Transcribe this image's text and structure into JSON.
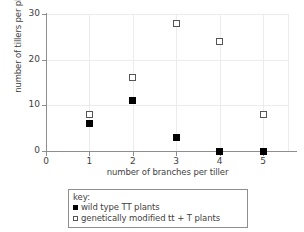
{
  "chart_data": {
    "type": "scatter",
    "title": "",
    "xlabel": "number of branches per tiller",
    "ylabel": "number of tillers per plant",
    "x": [
      1,
      2,
      3,
      4,
      5
    ],
    "xlim": [
      0,
      5.6
    ],
    "ylim": [
      0,
      30
    ],
    "xticks": [
      "0",
      "1",
      "2",
      "3",
      "4",
      "5"
    ],
    "yticks": [
      "0",
      "10",
      "20",
      "30"
    ],
    "grid": true,
    "legend_position": "below-axes",
    "legend_title": "key:",
    "series": [
      {
        "name": "wild type TT plants",
        "marker": "filled-square",
        "color": "#000000",
        "values": [
          6,
          11,
          3,
          0,
          0
        ]
      },
      {
        "name": "genetically modified tt + T plants",
        "marker": "open-square",
        "color": "#555555",
        "values": [
          8,
          16,
          28,
          24,
          8
        ]
      }
    ]
  },
  "legend": {
    "title": "key:",
    "entries": [
      {
        "marker": "filled-square",
        "label": "wild type TT plants"
      },
      {
        "marker": "open-square",
        "label": "genetically modified tt + T plants"
      }
    ]
  }
}
